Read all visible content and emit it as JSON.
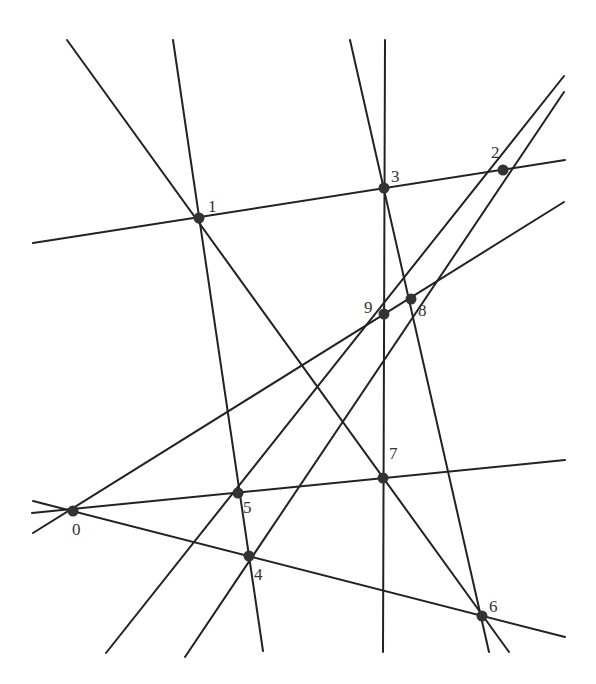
{
  "diagram": {
    "colors": {
      "line": "#222222",
      "point": "#333333",
      "label": "#333333",
      "background": "#ffffff"
    },
    "points": [
      {
        "id": "0",
        "label": "0",
        "x": 73,
        "y": 511,
        "lx": 72,
        "ly": 535
      },
      {
        "id": "1",
        "label": "1",
        "x": 199,
        "y": 218,
        "lx": 208,
        "ly": 212
      },
      {
        "id": "2",
        "label": "2",
        "x": 503,
        "y": 170,
        "lx": 491,
        "ly": 158
      },
      {
        "id": "3",
        "label": "3",
        "x": 384,
        "y": 188,
        "lx": 391,
        "ly": 182
      },
      {
        "id": "4",
        "label": "4",
        "x": 249,
        "y": 556,
        "lx": 254,
        "ly": 580
      },
      {
        "id": "5",
        "label": "5",
        "x": 238,
        "y": 493,
        "lx": 243,
        "ly": 513
      },
      {
        "id": "6",
        "label": "6",
        "x": 482,
        "y": 616,
        "lx": 489,
        "ly": 612
      },
      {
        "id": "7",
        "label": "7",
        "x": 383,
        "y": 478,
        "lx": 389,
        "ly": 459
      },
      {
        "id": "8",
        "label": "8",
        "x": 411,
        "y": 299,
        "lx": 418,
        "ly": 316
      },
      {
        "id": "9",
        "label": "9",
        "x": 384,
        "y": 314,
        "lx": 364,
        "ly": 313
      }
    ],
    "lines": [
      {
        "id": "L1-7-6",
        "through": [
          "1",
          "7",
          "6"
        ],
        "x1": 67,
        "y1": 40,
        "x2": 509,
        "y2": 652
      },
      {
        "id": "L1-5-4",
        "through": [
          "1",
          "5",
          "4"
        ],
        "x1": 173,
        "y1": 40,
        "x2": 263,
        "y2": 651
      },
      {
        "id": "L3-8-6",
        "through": [
          "3",
          "8",
          "6"
        ],
        "x1": 350,
        "y1": 40,
        "x2": 489,
        "y2": 652
      },
      {
        "id": "L3-9-7",
        "through": [
          "3",
          "9",
          "7"
        ],
        "x1": 385,
        "y1": 40,
        "x2": 383,
        "y2": 652
      },
      {
        "id": "L1-3-2",
        "through": [
          "1",
          "3",
          "2"
        ],
        "x1": 33,
        "y1": 243,
        "x2": 565,
        "y2": 160
      },
      {
        "id": "L2-9-5",
        "through": [
          "2",
          "9",
          "5"
        ],
        "x1": 564,
        "y1": 76,
        "x2": 106,
        "y2": 653
      },
      {
        "id": "L2-8-4",
        "through": [
          "2",
          "8",
          "4"
        ],
        "x1": 564,
        "y1": 92,
        "x2": 185,
        "y2": 657
      },
      {
        "id": "L8-9-0",
        "through": [
          "8",
          "9",
          "0"
        ],
        "x1": 564,
        "y1": 202,
        "x2": 33,
        "y2": 533
      },
      {
        "id": "L0-5-7",
        "through": [
          "0",
          "5",
          "7"
        ],
        "x1": 32,
        "y1": 513,
        "x2": 565,
        "y2": 460
      },
      {
        "id": "L0-4-6",
        "through": [
          "0",
          "4",
          "6"
        ],
        "x1": 33,
        "y1": 501,
        "x2": 565,
        "y2": 637
      }
    ]
  }
}
